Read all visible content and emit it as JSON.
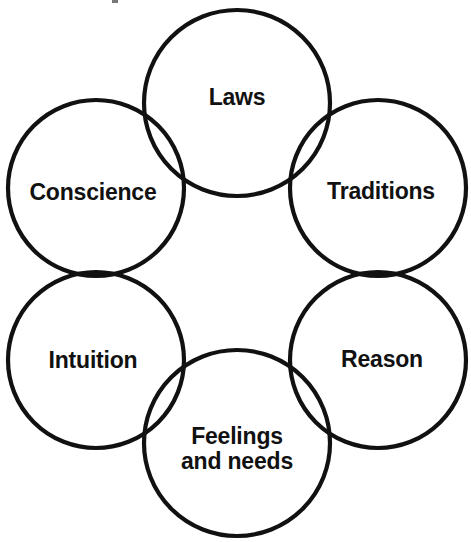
{
  "diagram": {
    "type": "venn-cluster",
    "background_color": "#ffffff",
    "stroke_color": "#111111",
    "stroke_width": 4.2,
    "text_color": "#111111",
    "canvas": {
      "width": 471,
      "height": 542
    },
    "nodes": [
      {
        "id": "laws",
        "label": "Laws",
        "lines": [
          "Laws"
        ],
        "cx": 237,
        "cy": 103,
        "r": 93,
        "label_x": 237,
        "label_y": 97
      },
      {
        "id": "conscience",
        "label": "Conscience",
        "lines": [
          "Conscience"
        ],
        "cx": 96,
        "cy": 188,
        "r": 88,
        "label_x": 93,
        "label_y": 192
      },
      {
        "id": "traditions",
        "label": "Traditions",
        "lines": [
          "Traditions"
        ],
        "cx": 378,
        "cy": 188,
        "r": 88,
        "label_x": 381,
        "label_y": 191
      },
      {
        "id": "intuition",
        "label": "Intuition",
        "lines": [
          "Intuition"
        ],
        "cx": 96,
        "cy": 360,
        "r": 88,
        "label_x": 93,
        "label_y": 360
      },
      {
        "id": "reason",
        "label": "Reason",
        "lines": [
          "Reason"
        ],
        "cx": 378,
        "cy": 360,
        "r": 88,
        "label_x": 382,
        "label_y": 359
      },
      {
        "id": "feelings-and-needs",
        "label": "Feelings and needs",
        "lines": [
          "Feelings",
          "and needs"
        ],
        "cx": 237,
        "cy": 443,
        "r": 93,
        "label_x": 237,
        "label_y": 449
      }
    ]
  }
}
